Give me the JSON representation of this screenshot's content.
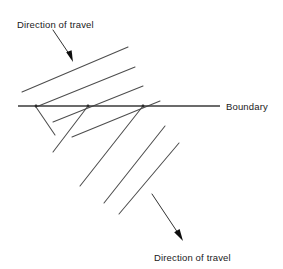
{
  "figure": {
    "type": "wave-refraction-diagram",
    "title": "",
    "background_color": "#ffffff",
    "stroke_color": "#4d4d4d",
    "boundary_color": "#3a3a3a",
    "arrow_color": "#1a1a1a",
    "text_color": "#1a1a1a",
    "width": 283,
    "height": 269
  },
  "labels": {
    "top_direction": "Direction of travel",
    "bottom_direction": "Direction of travel",
    "boundary": "Boundary"
  },
  "boundary": {
    "label": "Boundary",
    "x1": 18,
    "y1": 106,
    "x2": 220,
    "y2": 106,
    "stroke_width": 1.6
  },
  "arrows": [
    {
      "name": "top-direction-arrow",
      "x1": 53,
      "y1": 30,
      "x2": 73,
      "y2": 61,
      "head_length": 11,
      "head_width": 6
    },
    {
      "name": "bottom-direction-arrow",
      "x1": 152,
      "y1": 194,
      "x2": 183,
      "y2": 240,
      "head_length": 11,
      "head_width": 6
    }
  ],
  "wavefronts_incident": [
    {
      "name": "incident-wavefront-1",
      "x1": 22,
      "y1": 92,
      "x2": 128,
      "y2": 47
    },
    {
      "name": "incident-wavefront-2",
      "x1": 36,
      "y1": 107,
      "x2": 135,
      "y2": 67
    },
    {
      "name": "incident-wavefront-3",
      "x1": 53,
      "y1": 122,
      "x2": 143,
      "y2": 86
    },
    {
      "name": "incident-wavefront-4",
      "x1": 72,
      "y1": 137,
      "x2": 160,
      "y2": 101
    }
  ],
  "wavefronts_refracted": [
    {
      "name": "refracted-wavefront-1",
      "x1": 36,
      "y1": 107,
      "x2": 55,
      "y2": 135
    },
    {
      "name": "refracted-wavefront-2",
      "x1": 88,
      "y1": 106,
      "x2": 53,
      "y2": 152
    },
    {
      "name": "refracted-wavefront-3",
      "x1": 143,
      "y1": 106,
      "x2": 80,
      "y2": 186
    },
    {
      "name": "refracted-wavefront-4",
      "x1": 165,
      "y1": 126,
      "x2": 104,
      "y2": 203
    },
    {
      "name": "refracted-wavefront-5",
      "x1": 179,
      "y1": 143,
      "x2": 119,
      "y2": 214
    }
  ],
  "crossing_points": [
    {
      "name": "crossing-point-1",
      "x": 36,
      "y": 106
    },
    {
      "name": "crossing-point-2",
      "x": 88,
      "y": 106
    },
    {
      "name": "crossing-point-3",
      "x": 143,
      "y": 106
    }
  ],
  "geometry_notes": {
    "incident_angle_from_horizontal_deg": 23,
    "refracted_angle_from_horizontal_deg": 52
  }
}
